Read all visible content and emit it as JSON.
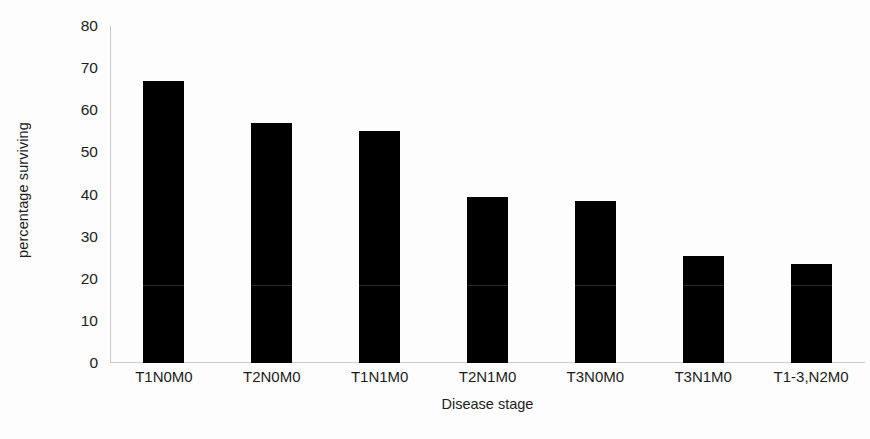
{
  "chart_data": {
    "type": "bar",
    "title": "",
    "xlabel": "Disease stage",
    "ylabel": "percentage surviving",
    "categories": [
      "T1N0M0",
      "T2N0M0",
      "T1N1M0",
      "T2N1M0",
      "T3N0M0",
      "T3N1M0",
      "T1-3,N2M0"
    ],
    "values": [
      67,
      57,
      55,
      39.5,
      38.5,
      25.5,
      23.5
    ],
    "ylim": [
      0,
      80
    ],
    "ytick_values": [
      0,
      10,
      20,
      30,
      40,
      50,
      60,
      70,
      80
    ],
    "ytick_labels": [
      "0",
      "10",
      "20",
      "30",
      "40",
      "50",
      "60",
      "70",
      "80"
    ],
    "grid": false,
    "legend": false,
    "bar_color": "#000000",
    "axis_color": "#cccccc",
    "background_color": "#fdfdfd"
  }
}
